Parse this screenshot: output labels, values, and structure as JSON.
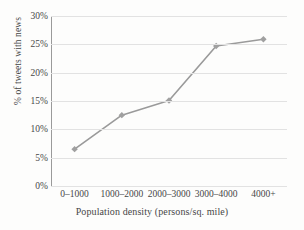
{
  "chart_data": {
    "type": "line",
    "title": "",
    "xlabel": "Population density (persons/sq. mile)",
    "ylabel": "% of tweets with news",
    "categories": [
      "0–1000",
      "1000–2000",
      "2000–3000",
      "3000–4000",
      "4000+"
    ],
    "values": [
      6.5,
      12.5,
      15.1,
      24.7,
      25.9
    ],
    "ylim": [
      0,
      30
    ],
    "ytick_values": [
      0,
      5,
      10,
      15,
      20,
      25,
      30
    ],
    "ytick_labels": [
      "0%",
      "5%",
      "10%",
      "15%",
      "20%",
      "25%",
      "30%"
    ],
    "ytick_format": "percent",
    "grid": "horizontal",
    "legend": "none",
    "series": [
      {
        "name": "% of tweets with news",
        "values": [
          6.5,
          12.5,
          15.1,
          24.7,
          25.9
        ],
        "line_color": "#9a9a9a",
        "marker": "diamond",
        "marker_color": "#a0a0a0"
      }
    ],
    "colors": {
      "line": "#9a9a9a",
      "marker": "#a0a0a0",
      "grid": "#e2e2e2",
      "axis": "#9a9a9a",
      "text": "#474747",
      "background": "#fdfdfc"
    }
  }
}
